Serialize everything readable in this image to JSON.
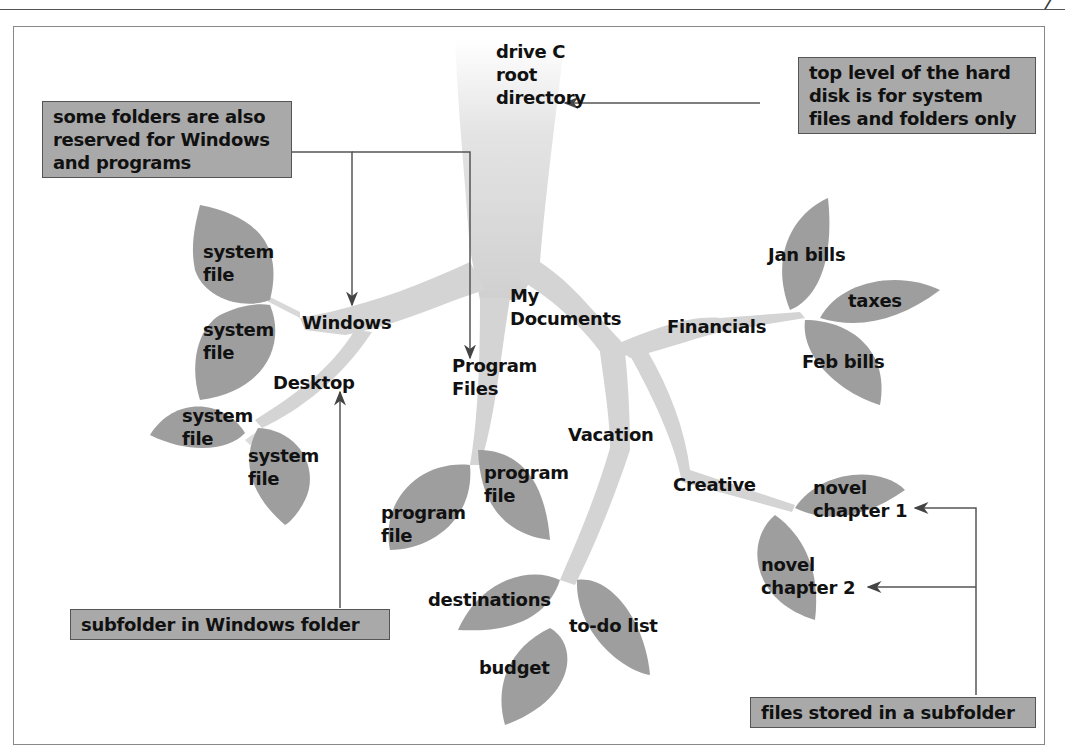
{
  "page": {
    "page_mark": "7"
  },
  "tree": {
    "root": "drive C\nroot\ndirectory",
    "root_lines": [
      "drive C",
      "root",
      "directory"
    ],
    "folders": {
      "windows": "Windows",
      "desktop": "Desktop",
      "program_files_lines": [
        "Program",
        "Files"
      ],
      "my_documents_lines": [
        "My",
        "Documents"
      ],
      "financials": "Financials",
      "vacation": "Vacation",
      "creative": "Creative"
    },
    "files": {
      "windows_files": [
        [
          "system",
          "file"
        ],
        [
          "system",
          "file"
        ]
      ],
      "desktop_files": [
        [
          "system",
          "file"
        ],
        [
          "system",
          "file"
        ]
      ],
      "program_files": [
        [
          "program",
          "file"
        ],
        [
          "program",
          "file"
        ]
      ],
      "financials_files": [
        "Jan bills",
        "taxes",
        "Feb bills"
      ],
      "vacation_files": [
        "destinations",
        "to-do list",
        "budget"
      ],
      "creative_files": [
        [
          "novel",
          "chapter 1"
        ],
        [
          "novel",
          "chapter 2"
        ]
      ]
    }
  },
  "callouts": {
    "top_level": [
      "top level of the hard",
      "disk is for system",
      "files and folders only"
    ],
    "reserved": [
      "some folders are also",
      "reserved for Windows",
      "and programs"
    ],
    "subfolder": "subfolder in Windows folder",
    "files_stored": "files stored in a subfolder"
  },
  "colors": {
    "trunk": "#d6d6d6",
    "leaf": "#9e9e9e",
    "callout_bg": "#a9a9a9",
    "arrow": "#555555"
  }
}
